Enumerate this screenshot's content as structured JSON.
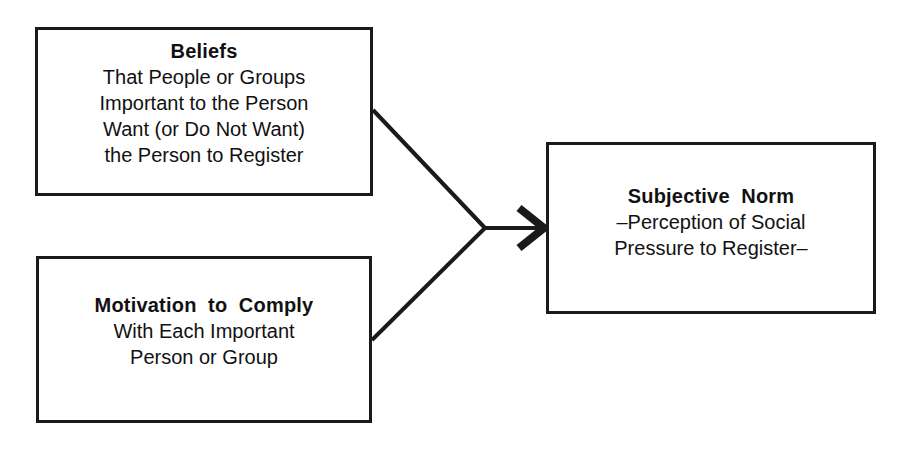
{
  "diagram": {
    "title": "Subjective Norm Determinants",
    "type": "flow-diagram",
    "background_color": "#ffffff",
    "stroke_color": "#1a1a1a",
    "text_color": "#111111",
    "nodes": [
      {
        "id": "beliefs",
        "title": "Beliefs",
        "lines": [
          "That People or Groups",
          "Important to the Person",
          "Want (or Do Not Want)",
          "the Person to Register"
        ]
      },
      {
        "id": "motivation",
        "title": "Motivation  to  Comply",
        "lines": [
          "With Each Important",
          "Person or Group"
        ]
      },
      {
        "id": "subjective_norm",
        "title": "Subjective  Norm",
        "lines": [
          "–Perception of Social",
          "Pressure to Register–"
        ]
      }
    ],
    "connectors": [
      {
        "id": "beliefs-to-junction",
        "from": "beliefs",
        "to": "junction",
        "style": "plain-line"
      },
      {
        "id": "motivation-to-junction",
        "from": "motivation",
        "to": "junction",
        "style": "plain-line"
      },
      {
        "id": "junction-to-subjective-norm",
        "from": "junction",
        "to": "subjective_norm",
        "style": "arrow",
        "arrowhead": "open-chevron"
      }
    ]
  }
}
